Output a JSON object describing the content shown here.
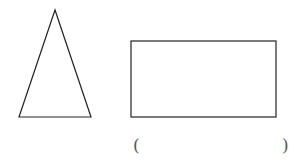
{
  "shapes": {
    "triangle": {
      "label": "isosceles triangle",
      "stroke": "#222222"
    },
    "rectangle": {
      "label": "rectangle",
      "stroke": "#222222"
    }
  },
  "answer_blank": {
    "open_paren": "(",
    "close_paren": ")",
    "value": ""
  }
}
